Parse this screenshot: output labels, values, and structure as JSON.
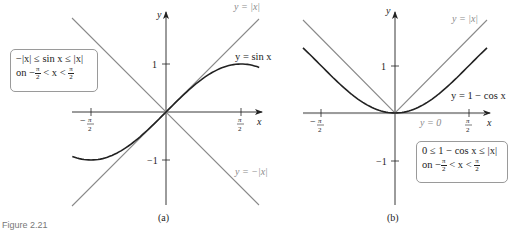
{
  "figure": {
    "caption": "Figure 2.21"
  },
  "panels": [
    {
      "id": "a",
      "label": "(a)",
      "axis_x_label": "x",
      "axis_y_label": "y",
      "x_ticks": [
        "−π/2",
        "π/2"
      ],
      "y_ticks": [
        "1",
        "−1"
      ],
      "curve_labels": {
        "upper_line": "y = |x|",
        "curve": "y = sin x",
        "lower_line": "y = −|x|"
      },
      "box": {
        "line1": "−|x| ≤ sin x ≤ |x|",
        "line2_prefix": "on −",
        "line2_mid": " < x < ",
        "frac_num": "π",
        "frac_den": "2"
      }
    },
    {
      "id": "b",
      "label": "(b)",
      "axis_x_label": "x",
      "axis_y_label": "y",
      "x_ticks": [
        "−π/2",
        "π/2"
      ],
      "y_ticks": [
        "1",
        "−1"
      ],
      "curve_labels": {
        "upper_line": "y = |x|",
        "curve": "y = 1 − cos x",
        "zero_line": "y = 0"
      },
      "box": {
        "line1": "0 ≤ 1 − cos x ≤ |x|",
        "line2_prefix": "on −",
        "line2_mid": " < x < ",
        "frac_num": "π",
        "frac_den": "2"
      }
    }
  ],
  "chart_data": [
    {
      "type": "line",
      "title": "(a)",
      "xlabel": "x",
      "ylabel": "y",
      "xlim": [
        -1.95,
        1.95
      ],
      "ylim": [
        -1.95,
        2.0
      ],
      "x_tick_labels": [
        "−π/2",
        "π/2"
      ],
      "y_tick_labels": [
        "1",
        "−1"
      ],
      "series": [
        {
          "name": "y = |x|",
          "color": "#8a8a8a",
          "x": [
            -1.95,
            0,
            1.95
          ],
          "y": [
            1.95,
            0,
            1.95
          ]
        },
        {
          "name": "y = −|x|",
          "color": "#8a8a8a",
          "x": [
            -1.95,
            0,
            1.95
          ],
          "y": [
            -1.95,
            0,
            -1.95
          ]
        },
        {
          "name": "y = sin x",
          "color": "#222222",
          "x": [
            -1.95,
            -1.5708,
            -1.0,
            -0.5,
            0,
            0.5,
            1.0,
            1.5708,
            1.95
          ],
          "y": [
            -0.929,
            -1.0,
            -0.841,
            -0.479,
            0,
            0.479,
            0.841,
            1.0,
            0.929
          ]
        }
      ],
      "annotation": "−|x| ≤ sin x ≤ |x| on −π/2 < x < π/2",
      "grid": false
    },
    {
      "type": "line",
      "title": "(b)",
      "xlabel": "x",
      "ylabel": "y",
      "xlim": [
        -1.95,
        1.95
      ],
      "ylim": [
        -1.95,
        2.0
      ],
      "x_tick_labels": [
        "−π/2",
        "π/2"
      ],
      "y_tick_labels": [
        "1",
        "−1"
      ],
      "series": [
        {
          "name": "y = |x|",
          "color": "#8a8a8a",
          "x": [
            -1.95,
            0,
            1.95
          ],
          "y": [
            1.95,
            0,
            1.95
          ]
        },
        {
          "name": "y = 1 − cos x",
          "color": "#222222",
          "x": [
            -1.95,
            -1.5708,
            -1.0,
            -0.5,
            0,
            0.5,
            1.0,
            1.5708,
            1.95
          ],
          "y": [
            1.371,
            1.0,
            0.46,
            0.122,
            0,
            0.122,
            0.46,
            1.0,
            1.371
          ]
        },
        {
          "name": "y = 0",
          "color": "#8a8a8a",
          "x": [
            -1.95,
            1.95
          ],
          "y": [
            0,
            0
          ]
        }
      ],
      "annotation": "0 ≤ 1 − cos x ≤ |x| on −π/2 < x < π/2",
      "grid": false
    }
  ]
}
